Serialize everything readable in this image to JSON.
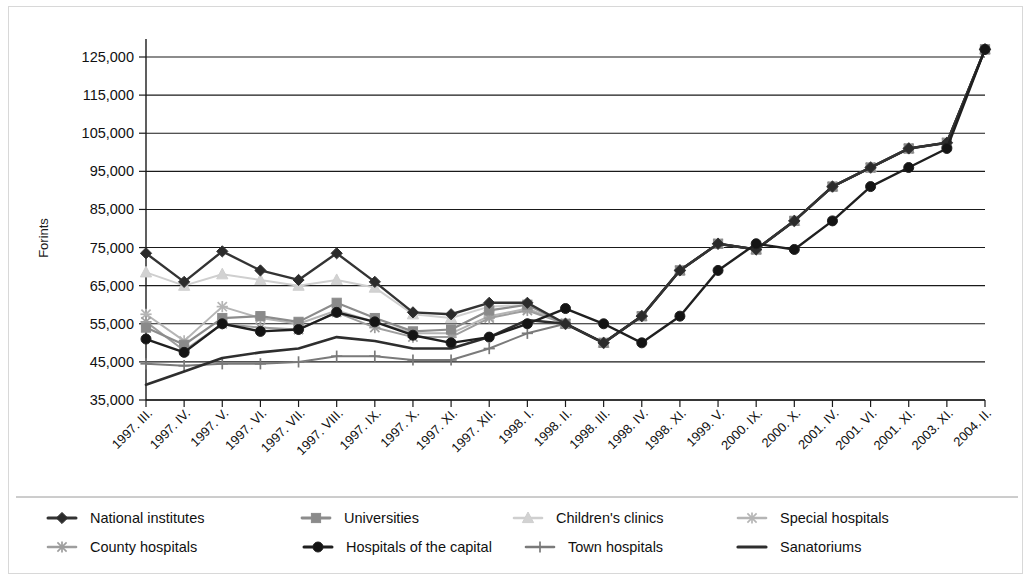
{
  "chart_data": {
    "type": "line",
    "title": "",
    "xlabel": "",
    "ylabel": "Forints",
    "ylim": [
      35000,
      130000
    ],
    "yticks": [
      35000,
      45000,
      55000,
      65000,
      75000,
      85000,
      95000,
      105000,
      115000,
      125000
    ],
    "ytick_labels": [
      "35,000",
      "45,000",
      "55,000",
      "65,000",
      "75,000",
      "85,000",
      "95,000",
      "105,000",
      "115,000",
      "125,000"
    ],
    "grid": true,
    "legend_position": "bottom",
    "categories": [
      "1997. III.",
      "1997. IV.",
      "1997. V.",
      "1997. VI.",
      "1997. VII.",
      "1997. VIII.",
      "1997. IX.",
      "1997. X.",
      "1997. XI.",
      "1997. XII.",
      "1998. I.",
      "1998. II.",
      "1998. III.",
      "1998. IV.",
      "1998. XI.",
      "1999. V.",
      "2000. IX.",
      "2000. X.",
      "2001. IV.",
      "2001. VI.",
      "2001. XI.",
      "2003. XI.",
      "2004. II."
    ],
    "series": [
      {
        "name": "National institutes",
        "color": "#333333",
        "marker": "diamond",
        "marker_fill": "#2b2b2b",
        "width": 2.4,
        "values": [
          73500,
          66000,
          74000,
          69000,
          66500,
          73500,
          66000,
          58000,
          57500,
          60500,
          60500,
          55000,
          50000,
          57000,
          69000,
          76000,
          74500,
          82000,
          91000,
          96000,
          101000,
          102500,
          127000
        ]
      },
      {
        "name": "Universities",
        "color": "#8c8c8c",
        "marker": "square",
        "marker_fill": "#8a8a8a",
        "width": 2.2,
        "values": [
          54000,
          49500,
          56500,
          57000,
          55500,
          60500,
          56500,
          53000,
          53500,
          58500,
          60000,
          55000,
          50000,
          57000,
          69000,
          76000,
          74500,
          82000,
          91000,
          96000,
          101000,
          102500,
          127000
        ]
      },
      {
        "name": "Children's clinics",
        "color": "#cfcfcf",
        "marker": "triangle",
        "marker_fill": "#d2d2d2",
        "width": 2.0,
        "values": [
          68500,
          65000,
          68000,
          66500,
          65000,
          66500,
          64500,
          57500,
          56500,
          59500,
          60000,
          55000,
          50000,
          57000,
          69000,
          76000,
          74500,
          82000,
          91000,
          96000,
          101000,
          102500,
          127000
        ]
      },
      {
        "name": "Special hospitals",
        "color": "#b5b5b5",
        "marker": "star",
        "marker_fill": "#b2b2b2",
        "width": 2.0,
        "values": [
          57500,
          50500,
          59500,
          56500,
          55000,
          58500,
          55500,
          52500,
          52500,
          57000,
          59000,
          55000,
          50000,
          57000,
          69000,
          76000,
          74500,
          82000,
          91000,
          96000,
          101000,
          102500,
          127000
        ]
      },
      {
        "name": "County hospitals",
        "color": "#9e9e9e",
        "marker": "star",
        "marker_fill": "#9c9c9c",
        "width": 2.0,
        "values": [
          55500,
          48000,
          55000,
          54000,
          53500,
          58000,
          54000,
          51500,
          51500,
          56500,
          58500,
          55000,
          50000,
          57000,
          69000,
          76000,
          74500,
          82000,
          91000,
          96000,
          101000,
          102500,
          127000
        ]
      },
      {
        "name": "Hospitals of the capital",
        "color": "#1f1f1f",
        "marker": "circle",
        "marker_fill": "#141414",
        "width": 2.4,
        "values": [
          51000,
          47500,
          55000,
          53000,
          53500,
          58000,
          55500,
          52000,
          50000,
          51500,
          55000,
          59000,
          55000,
          50000,
          57000,
          69000,
          76000,
          74500,
          82000,
          91000,
          96000,
          101000,
          127000
        ]
      },
      {
        "name": "Town hospitals",
        "color": "#7a7a7a",
        "marker": "plus",
        "marker_fill": "#787878",
        "width": 2.0,
        "values": [
          44500,
          44000,
          44500,
          44500,
          45000,
          46500,
          46500,
          45500,
          45500,
          48500,
          52500,
          55000,
          50000,
          57000,
          69000,
          76000,
          74500,
          82000,
          91000,
          96000,
          101000,
          102500,
          127000
        ]
      },
      {
        "name": "Sanatoriums",
        "color": "#2e2e2e",
        "marker": "none",
        "marker_fill": "#2e2e2e",
        "width": 2.6,
        "values": [
          39000,
          42500,
          46000,
          47500,
          48500,
          51500,
          50500,
          48500,
          48500,
          51500,
          56000,
          55000,
          50000,
          57000,
          69000,
          76000,
          74500,
          82000,
          91000,
          96000,
          101000,
          102500,
          127000
        ]
      }
    ],
    "legend_rows": [
      [
        "National institutes",
        "Universities",
        "Children's clinics",
        "Special hospitals"
      ],
      [
        "County hospitals",
        "Hospitals of the capital",
        "Town hospitals",
        "Sanatoriums"
      ]
    ]
  }
}
